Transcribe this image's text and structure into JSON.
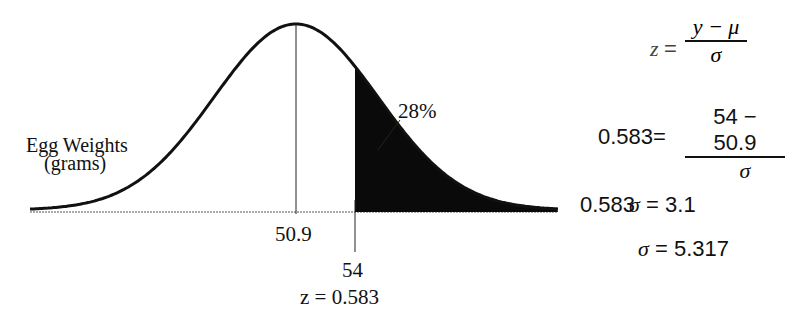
{
  "diagram": {
    "title_line1": "Egg Weights",
    "title_line2": "(grams)",
    "mean_label": "50.9",
    "cutoff_label": "54",
    "z_label": "z = 0.583",
    "area_label": "28%",
    "colors": {
      "curve": "#111111",
      "shade": "#0a0a0a",
      "background": "#ffffff"
    }
  },
  "equations": {
    "eq1": {
      "lhs": "z",
      "eq": "=",
      "num": "y − μ",
      "den": "σ"
    },
    "eq2": {
      "lhs": "0.583",
      "eq": "=",
      "num": "54 − 50.9",
      "den": "σ"
    },
    "eq3": {
      "lhs_num": "0.583",
      "lhs_sym": "σ",
      "eq": "=",
      "rhs": "3.1"
    },
    "eq4": {
      "lhs": "σ",
      "eq": "=",
      "rhs": "5.317"
    }
  },
  "chart_data": {
    "type": "normal-curve",
    "variable": "Egg Weights (grams)",
    "mean": 50.9,
    "cutoff": 54,
    "z": 0.583,
    "shaded_region": "right tail (y > 54)",
    "shaded_area_percent": 28,
    "sigma": 5.317
  }
}
